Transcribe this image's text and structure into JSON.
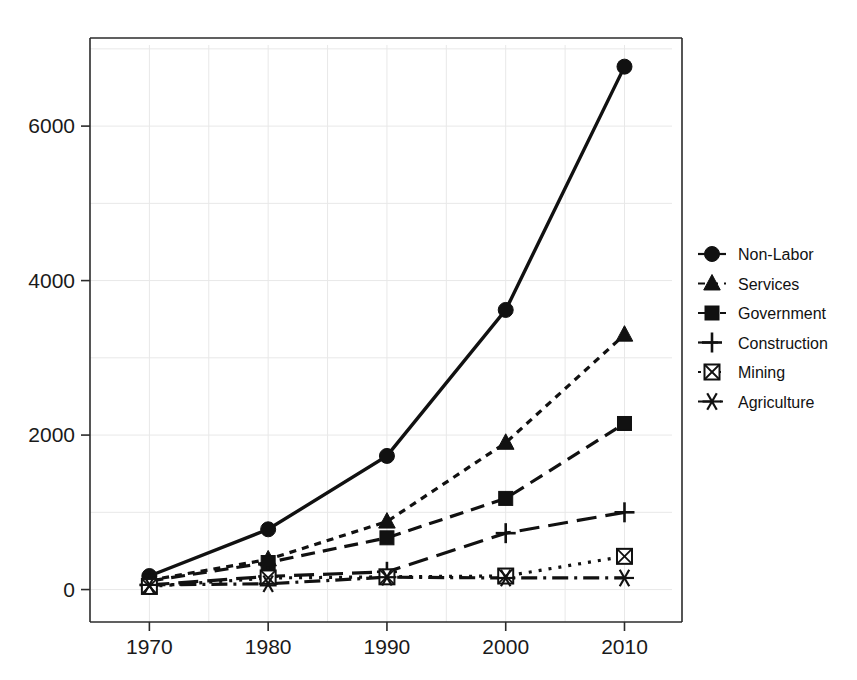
{
  "chart_data": {
    "type": "line",
    "title": "",
    "subtitle": "",
    "xlabel": "",
    "ylabel": "",
    "x": [
      1970,
      1980,
      1990,
      2000,
      2010
    ],
    "xticklabels": [
      "1970",
      "1980",
      "1990",
      "2000",
      "2010"
    ],
    "yticks": [
      0,
      2000,
      4000,
      6000
    ],
    "yticklabels": [
      "0",
      "2000",
      "4000",
      "6000"
    ],
    "xlim": [
      1965,
      2014
    ],
    "ylim": [
      -420,
      7050
    ],
    "grid": true,
    "legend_position": "right",
    "series": [
      {
        "name": "Non-Labor",
        "marker": "filled-circle",
        "linestyle": "solid",
        "values": [
          175,
          780,
          1730,
          3620,
          6770
        ]
      },
      {
        "name": "Services",
        "marker": "filled-triangle",
        "linestyle": "dotted",
        "values": [
          120,
          390,
          880,
          1900,
          3300
        ]
      },
      {
        "name": "Government",
        "marker": "filled-square",
        "linestyle": "dashed",
        "values": [
          110,
          350,
          670,
          1180,
          2150
        ]
      },
      {
        "name": "Construction",
        "marker": "plus",
        "linestyle": "long-dash",
        "values": [
          60,
          170,
          230,
          730,
          1000
        ]
      },
      {
        "name": "Mining",
        "marker": "crossed-square",
        "linestyle": "fine-dotted",
        "values": [
          40,
          150,
          165,
          175,
          430
        ]
      },
      {
        "name": "Agriculture",
        "marker": "asterisk",
        "linestyle": "dash-dot",
        "values": [
          60,
          75,
          160,
          150,
          150
        ]
      }
    ]
  },
  "legend": {
    "items": [
      {
        "label": "Non-Labor"
      },
      {
        "label": "Services"
      },
      {
        "label": "Government"
      },
      {
        "label": "Construction"
      },
      {
        "label": "Mining"
      },
      {
        "label": "Agriculture"
      }
    ]
  },
  "colors": {
    "ink": "#111111",
    "grid": "#e8e8e8",
    "axis": "#2b2b2b",
    "background": "#ffffff"
  }
}
